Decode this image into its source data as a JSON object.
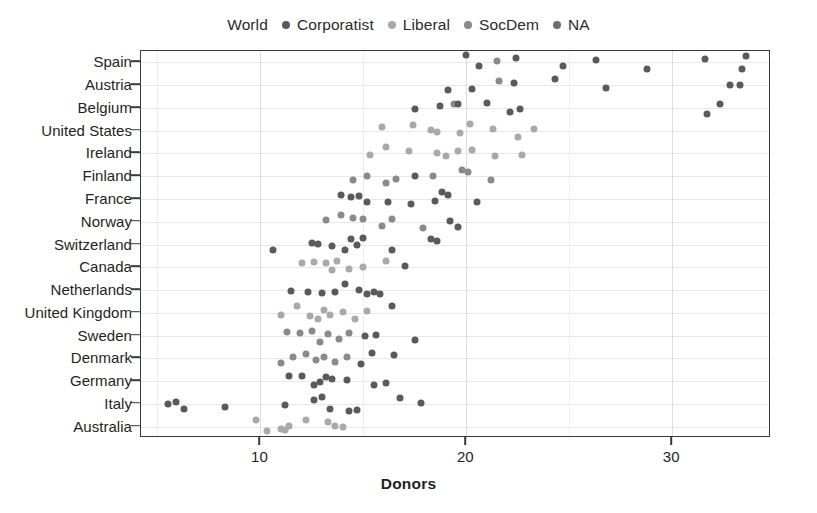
{
  "chart_data": {
    "type": "scatter",
    "title": "",
    "xlabel": "Donors",
    "ylabel": "",
    "xlim": [
      4.2,
      34.8
    ],
    "ylim_categories": [
      "Australia",
      "Italy",
      "Germany",
      "Denmark",
      "Sweden",
      "United Kingdom",
      "Netherlands",
      "Canada",
      "Switzerland",
      "Norway",
      "France",
      "Finland",
      "Ireland",
      "United States",
      "Belgium",
      "Austria",
      "Spain"
    ],
    "x_ticks": [
      10,
      20,
      30
    ],
    "x_tick_labels": [
      "10",
      "20",
      "30"
    ],
    "grid": "both",
    "legend_position": "top",
    "legend_title": "World",
    "series": [
      {
        "name": "Corporatist",
        "color": "#5a5a5a"
      },
      {
        "name": "Liberal",
        "color": "#a9a9a9"
      },
      {
        "name": "SocDem",
        "color": "#8a8a8a"
      },
      {
        "name": "NA",
        "color": "#6e6e6e"
      }
    ],
    "points": [
      {
        "x": 20.0,
        "y": "Spain",
        "s": 0
      },
      {
        "x": 20.6,
        "y": "Spain",
        "s": 0
      },
      {
        "x": 21.5,
        "y": "Spain",
        "s": 2
      },
      {
        "x": 22.4,
        "y": "Spain",
        "s": 0
      },
      {
        "x": 24.7,
        "y": "Spain",
        "s": 0
      },
      {
        "x": 26.3,
        "y": "Spain",
        "s": 0
      },
      {
        "x": 28.8,
        "y": "Spain",
        "s": 0
      },
      {
        "x": 31.6,
        "y": "Spain",
        "s": 0
      },
      {
        "x": 33.4,
        "y": "Spain",
        "s": 0
      },
      {
        "x": 33.6,
        "y": "Spain",
        "s": 0
      },
      {
        "x": 19.1,
        "y": "Austria",
        "s": 0
      },
      {
        "x": 20.3,
        "y": "Austria",
        "s": 0
      },
      {
        "x": 21.6,
        "y": "Austria",
        "s": 2
      },
      {
        "x": 22.3,
        "y": "Austria",
        "s": 0
      },
      {
        "x": 24.3,
        "y": "Austria",
        "s": 0
      },
      {
        "x": 26.8,
        "y": "Austria",
        "s": 0
      },
      {
        "x": 32.8,
        "y": "Austria",
        "s": 0
      },
      {
        "x": 33.3,
        "y": "Austria",
        "s": 0
      },
      {
        "x": 17.5,
        "y": "Belgium",
        "s": 0
      },
      {
        "x": 18.7,
        "y": "Belgium",
        "s": 0
      },
      {
        "x": 19.4,
        "y": "Belgium",
        "s": 2
      },
      {
        "x": 19.6,
        "y": "Belgium",
        "s": 0
      },
      {
        "x": 21.0,
        "y": "Belgium",
        "s": 0
      },
      {
        "x": 22.1,
        "y": "Belgium",
        "s": 0
      },
      {
        "x": 22.6,
        "y": "Belgium",
        "s": 0
      },
      {
        "x": 31.7,
        "y": "Belgium",
        "s": 0
      },
      {
        "x": 32.3,
        "y": "Belgium",
        "s": 0
      },
      {
        "x": 15.9,
        "y": "United States",
        "s": 1
      },
      {
        "x": 17.4,
        "y": "United States",
        "s": 1
      },
      {
        "x": 18.3,
        "y": "United States",
        "s": 1
      },
      {
        "x": 18.6,
        "y": "United States",
        "s": 1
      },
      {
        "x": 19.7,
        "y": "United States",
        "s": 1
      },
      {
        "x": 20.2,
        "y": "United States",
        "s": 1
      },
      {
        "x": 21.3,
        "y": "United States",
        "s": 1
      },
      {
        "x": 22.5,
        "y": "United States",
        "s": 1
      },
      {
        "x": 23.3,
        "y": "United States",
        "s": 1
      },
      {
        "x": 15.3,
        "y": "Ireland",
        "s": 1
      },
      {
        "x": 16.1,
        "y": "Ireland",
        "s": 1
      },
      {
        "x": 17.2,
        "y": "Ireland",
        "s": 1
      },
      {
        "x": 18.6,
        "y": "Ireland",
        "s": 1
      },
      {
        "x": 19.0,
        "y": "Ireland",
        "s": 1
      },
      {
        "x": 19.6,
        "y": "Ireland",
        "s": 1
      },
      {
        "x": 20.3,
        "y": "Ireland",
        "s": 1
      },
      {
        "x": 21.4,
        "y": "Ireland",
        "s": 1
      },
      {
        "x": 22.7,
        "y": "Ireland",
        "s": 1
      },
      {
        "x": 14.5,
        "y": "Finland",
        "s": 2
      },
      {
        "x": 15.2,
        "y": "Finland",
        "s": 2
      },
      {
        "x": 16.1,
        "y": "Finland",
        "s": 2
      },
      {
        "x": 16.6,
        "y": "Finland",
        "s": 2
      },
      {
        "x": 17.5,
        "y": "Finland",
        "s": 0
      },
      {
        "x": 18.4,
        "y": "Finland",
        "s": 2
      },
      {
        "x": 19.8,
        "y": "Finland",
        "s": 2
      },
      {
        "x": 20.1,
        "y": "Finland",
        "s": 2
      },
      {
        "x": 21.2,
        "y": "Finland",
        "s": 2
      },
      {
        "x": 13.9,
        "y": "France",
        "s": 0
      },
      {
        "x": 14.4,
        "y": "France",
        "s": 0
      },
      {
        "x": 14.8,
        "y": "France",
        "s": 0
      },
      {
        "x": 15.2,
        "y": "France",
        "s": 0
      },
      {
        "x": 16.2,
        "y": "France",
        "s": 0
      },
      {
        "x": 17.3,
        "y": "France",
        "s": 0
      },
      {
        "x": 18.5,
        "y": "France",
        "s": 0
      },
      {
        "x": 18.8,
        "y": "France",
        "s": 0
      },
      {
        "x": 19.1,
        "y": "France",
        "s": 0
      },
      {
        "x": 20.5,
        "y": "France",
        "s": 0
      },
      {
        "x": 13.2,
        "y": "Norway",
        "s": 2
      },
      {
        "x": 13.9,
        "y": "Norway",
        "s": 2
      },
      {
        "x": 14.5,
        "y": "Norway",
        "s": 2
      },
      {
        "x": 15.0,
        "y": "Norway",
        "s": 2
      },
      {
        "x": 15.9,
        "y": "Norway",
        "s": 2
      },
      {
        "x": 16.4,
        "y": "Norway",
        "s": 2
      },
      {
        "x": 17.9,
        "y": "Norway",
        "s": 2
      },
      {
        "x": 19.2,
        "y": "Norway",
        "s": 0
      },
      {
        "x": 19.6,
        "y": "Norway",
        "s": 0
      },
      {
        "x": 10.6,
        "y": "Switzerland",
        "s": 0
      },
      {
        "x": 12.5,
        "y": "Switzerland",
        "s": 0
      },
      {
        "x": 12.8,
        "y": "Switzerland",
        "s": 0
      },
      {
        "x": 13.5,
        "y": "Switzerland",
        "s": 0
      },
      {
        "x": 14.1,
        "y": "Switzerland",
        "s": 0
      },
      {
        "x": 14.4,
        "y": "Switzerland",
        "s": 0
      },
      {
        "x": 14.7,
        "y": "Switzerland",
        "s": 0
      },
      {
        "x": 15.0,
        "y": "Switzerland",
        "s": 0
      },
      {
        "x": 16.4,
        "y": "Switzerland",
        "s": 0
      },
      {
        "x": 18.3,
        "y": "Switzerland",
        "s": 0
      },
      {
        "x": 18.6,
        "y": "Switzerland",
        "s": 0
      },
      {
        "x": 12.0,
        "y": "Canada",
        "s": 1
      },
      {
        "x": 12.6,
        "y": "Canada",
        "s": 1
      },
      {
        "x": 13.2,
        "y": "Canada",
        "s": 1
      },
      {
        "x": 13.5,
        "y": "Canada",
        "s": 1
      },
      {
        "x": 13.7,
        "y": "Canada",
        "s": 1
      },
      {
        "x": 14.3,
        "y": "Canada",
        "s": 1
      },
      {
        "x": 15.0,
        "y": "Canada",
        "s": 1
      },
      {
        "x": 16.1,
        "y": "Canada",
        "s": 1
      },
      {
        "x": 17.0,
        "y": "Canada",
        "s": 0
      },
      {
        "x": 11.5,
        "y": "Netherlands",
        "s": 0
      },
      {
        "x": 12.3,
        "y": "Netherlands",
        "s": 0
      },
      {
        "x": 13.0,
        "y": "Netherlands",
        "s": 0
      },
      {
        "x": 13.6,
        "y": "Netherlands",
        "s": 0
      },
      {
        "x": 14.1,
        "y": "Netherlands",
        "s": 0
      },
      {
        "x": 14.8,
        "y": "Netherlands",
        "s": 0
      },
      {
        "x": 15.2,
        "y": "Netherlands",
        "s": 0
      },
      {
        "x": 15.5,
        "y": "Netherlands",
        "s": 0
      },
      {
        "x": 15.8,
        "y": "Netherlands",
        "s": 0
      },
      {
        "x": 11.0,
        "y": "United Kingdom",
        "s": 1
      },
      {
        "x": 11.8,
        "y": "United Kingdom",
        "s": 1
      },
      {
        "x": 12.4,
        "y": "United Kingdom",
        "s": 1
      },
      {
        "x": 12.8,
        "y": "United Kingdom",
        "s": 1
      },
      {
        "x": 13.1,
        "y": "United Kingdom",
        "s": 1
      },
      {
        "x": 13.4,
        "y": "United Kingdom",
        "s": 1
      },
      {
        "x": 14.0,
        "y": "United Kingdom",
        "s": 1
      },
      {
        "x": 14.6,
        "y": "United Kingdom",
        "s": 1
      },
      {
        "x": 15.2,
        "y": "United Kingdom",
        "s": 1
      },
      {
        "x": 16.4,
        "y": "United Kingdom",
        "s": 0
      },
      {
        "x": 11.3,
        "y": "Sweden",
        "s": 2
      },
      {
        "x": 11.9,
        "y": "Sweden",
        "s": 2
      },
      {
        "x": 12.5,
        "y": "Sweden",
        "s": 2
      },
      {
        "x": 12.9,
        "y": "Sweden",
        "s": 2
      },
      {
        "x": 13.3,
        "y": "Sweden",
        "s": 2
      },
      {
        "x": 13.8,
        "y": "Sweden",
        "s": 2
      },
      {
        "x": 14.3,
        "y": "Sweden",
        "s": 2
      },
      {
        "x": 15.1,
        "y": "Sweden",
        "s": 0
      },
      {
        "x": 15.6,
        "y": "Sweden",
        "s": 0
      },
      {
        "x": 17.5,
        "y": "Sweden",
        "s": 0
      },
      {
        "x": 11.0,
        "y": "Denmark",
        "s": 2
      },
      {
        "x": 11.6,
        "y": "Denmark",
        "s": 2
      },
      {
        "x": 12.2,
        "y": "Denmark",
        "s": 2
      },
      {
        "x": 12.7,
        "y": "Denmark",
        "s": 2
      },
      {
        "x": 13.1,
        "y": "Denmark",
        "s": 2
      },
      {
        "x": 13.6,
        "y": "Denmark",
        "s": 2
      },
      {
        "x": 14.2,
        "y": "Denmark",
        "s": 2
      },
      {
        "x": 14.9,
        "y": "Denmark",
        "s": 0
      },
      {
        "x": 15.4,
        "y": "Denmark",
        "s": 0
      },
      {
        "x": 16.5,
        "y": "Denmark",
        "s": 0
      },
      {
        "x": 11.4,
        "y": "Germany",
        "s": 0
      },
      {
        "x": 12.0,
        "y": "Germany",
        "s": 0
      },
      {
        "x": 12.6,
        "y": "Germany",
        "s": 0
      },
      {
        "x": 12.9,
        "y": "Germany",
        "s": 0
      },
      {
        "x": 13.2,
        "y": "Germany",
        "s": 0
      },
      {
        "x": 13.5,
        "y": "Germany",
        "s": 0
      },
      {
        "x": 14.2,
        "y": "Germany",
        "s": 0
      },
      {
        "x": 15.5,
        "y": "Germany",
        "s": 0
      },
      {
        "x": 16.1,
        "y": "Germany",
        "s": 0
      },
      {
        "x": 5.5,
        "y": "Italy",
        "s": 0
      },
      {
        "x": 5.9,
        "y": "Italy",
        "s": 0
      },
      {
        "x": 6.3,
        "y": "Italy",
        "s": 0
      },
      {
        "x": 8.3,
        "y": "Italy",
        "s": 0
      },
      {
        "x": 11.2,
        "y": "Italy",
        "s": 0
      },
      {
        "x": 12.6,
        "y": "Italy",
        "s": 0
      },
      {
        "x": 13.0,
        "y": "Italy",
        "s": 0
      },
      {
        "x": 13.4,
        "y": "Italy",
        "s": 0
      },
      {
        "x": 14.3,
        "y": "Italy",
        "s": 0
      },
      {
        "x": 14.7,
        "y": "Italy",
        "s": 0
      },
      {
        "x": 16.8,
        "y": "Italy",
        "s": 0
      },
      {
        "x": 17.8,
        "y": "Italy",
        "s": 0
      },
      {
        "x": 9.8,
        "y": "Australia",
        "s": 1
      },
      {
        "x": 10.3,
        "y": "Australia",
        "s": 1
      },
      {
        "x": 11.0,
        "y": "Australia",
        "s": 1
      },
      {
        "x": 11.2,
        "y": "Australia",
        "s": 1
      },
      {
        "x": 11.4,
        "y": "Australia",
        "s": 1
      },
      {
        "x": 12.2,
        "y": "Australia",
        "s": 1
      },
      {
        "x": 13.3,
        "y": "Australia",
        "s": 1
      },
      {
        "x": 13.6,
        "y": "Australia",
        "s": 1
      },
      {
        "x": 14.0,
        "y": "Australia",
        "s": 1
      }
    ]
  }
}
